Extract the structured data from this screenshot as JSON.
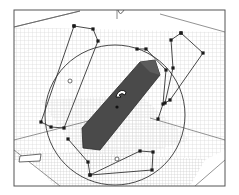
{
  "viewport": {
    "name": "3D viewport",
    "background": "#ffffff",
    "frame_color": "#555555",
    "grid_color": "#c8c8c8",
    "shape_fill": "#4a4a4a",
    "line_color": "#333333",
    "point_color": "#1a1a1a"
  },
  "frame": {
    "x": 14,
    "y": 10,
    "width": 211,
    "height": 176
  },
  "room": {
    "back_top_left": [
      14,
      27
    ],
    "back_top_right": [
      225,
      32
    ],
    "floor_left": [
      14,
      150
    ],
    "floor_front_right": [
      225,
      160
    ]
  },
  "gizmo_circle": {
    "cx": 115,
    "cy": 115,
    "r": 70
  },
  "shape": {
    "label": "extruded prism",
    "points": [
      [
        83,
        148
      ],
      [
        100,
        150
      ],
      [
        160,
        75
      ],
      [
        155,
        60
      ],
      [
        140,
        62
      ],
      [
        82,
        128
      ]
    ]
  },
  "cursor": {
    "label": "rotate-cursor",
    "x": 122,
    "y": 95
  },
  "center_point": {
    "x": 117,
    "y": 107
  },
  "polylines": [
    {
      "name": "left-outline",
      "points": [
        [
          74,
          26
        ],
        [
          93,
          29
        ],
        [
          98,
          41
        ],
        [
          64,
          128
        ],
        [
          51,
          127
        ],
        [
          41,
          122
        ],
        [
          74,
          26
        ]
      ]
    },
    {
      "name": "top-right-outline",
      "points": [
        [
          181,
          33
        ],
        [
          203,
          53
        ],
        [
          170,
          100
        ],
        [
          165,
          103
        ],
        [
          173,
          68
        ],
        [
          171,
          40
        ],
        [
          181,
          33
        ]
      ]
    },
    {
      "name": "mid-outline",
      "points": [
        [
          137,
          49
        ],
        [
          146,
          49
        ],
        [
          166,
          70
        ],
        [
          163,
          104
        ],
        [
          158,
          119
        ]
      ]
    },
    {
      "name": "bottom-outline",
      "points": [
        [
          68,
          139
        ],
        [
          88,
          162
        ],
        [
          90,
          175
        ],
        [
          140,
          151
        ],
        [
          153,
          152
        ],
        [
          152,
          170
        ],
        [
          90,
          175
        ]
      ]
    }
  ],
  "small_markers": [
    {
      "name": "marker-left",
      "x": 70,
      "y": 81
    },
    {
      "name": "marker-bottom",
      "x": 117,
      "y": 159
    }
  ],
  "bottom_box": {
    "x": 20,
    "y": 154,
    "width": 21,
    "height": 7
  },
  "top_notch": {
    "x": 120,
    "y": 10
  }
}
